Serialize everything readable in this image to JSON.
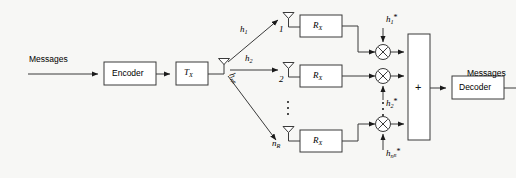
{
  "figure": {
    "background_color": "#f7f7f5",
    "stroke_color": "#3a3a3a",
    "text_color": "#000000"
  },
  "transmitter": {
    "input_label": "Messages",
    "encoder_label": "Encoder",
    "tx_label": "T",
    "tx_sub": "X",
    "antenna_name": "transmit-antenna"
  },
  "channel": {
    "paths": [
      {
        "gain": "h",
        "sub": "1",
        "target": "1"
      },
      {
        "gain": "h",
        "sub": "2",
        "target": "2"
      },
      {
        "gain": "h",
        "sub": "n",
        "sub2": "R",
        "target": "n"
      }
    ]
  },
  "receiver": {
    "branches": [
      {
        "antenna_index": "1",
        "antenna_sub": "",
        "rx_label": "R",
        "rx_sub": "X",
        "weight": "h",
        "weight_sub": "1",
        "weight_star": "*"
      },
      {
        "antenna_index": "2",
        "antenna_sub": "",
        "rx_label": "R",
        "rx_sub": "X",
        "weight": "h",
        "weight_sub": "2",
        "weight_star": "*"
      },
      {
        "antenna_index": "n",
        "antenna_sub": "R",
        "rx_label": "R",
        "rx_sub": "X",
        "weight": "h",
        "weight_sub": "n",
        "weight_sub2": "R",
        "weight_star": "*"
      }
    ],
    "multiplier_symbol": "×",
    "combiner_label": "+",
    "decoder_label": "Decoder",
    "output_label": "Messages"
  },
  "ellipsis": {
    "antenna_column_dots": 3,
    "multiplier_column_dots": 3
  }
}
